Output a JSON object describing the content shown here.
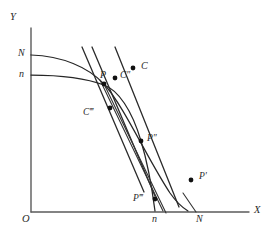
{
  "figure": {
    "background_color": "#ffffff",
    "ink_color": "#262626",
    "axis_color": "#5b5b5b",
    "width": 273,
    "height": 244
  },
  "axes": {
    "y_axis_label": "Y",
    "x_axis_label": "X",
    "origin_label": "O",
    "y_tick_labels": [
      {
        "label": "N",
        "value_y": 55
      },
      {
        "label": "n",
        "value_y": 75
      }
    ],
    "x_tick_labels": [
      {
        "label": "n",
        "value_x": 155
      },
      {
        "label": "N",
        "value_x": 200
      }
    ]
  },
  "points": [
    {
      "name": "P",
      "label": "P",
      "x": 104,
      "y": 84,
      "label_x": 100,
      "label_y": 70
    },
    {
      "name": "Cpp",
      "label": "C″",
      "x": 115,
      "y": 78,
      "label_x": 120,
      "label_y": 72
    },
    {
      "name": "C",
      "label": "C",
      "x": 133,
      "y": 68,
      "label_x": 140,
      "label_y": 62
    },
    {
      "name": "Cppp",
      "label": "C‴",
      "x": 110,
      "y": 108,
      "label_x": 85,
      "label_y": 108
    },
    {
      "name": "Ppp",
      "label": "P″",
      "x": 141,
      "y": 141,
      "label_x": 147,
      "label_y": 134
    },
    {
      "name": "Pp",
      "label": "P′",
      "x": 191,
      "y": 180,
      "label_x": 198,
      "label_y": 173
    },
    {
      "name": "Pppp",
      "label": "P‴",
      "x": 155,
      "y": 199,
      "label_x": 136,
      "label_y": 196
    }
  ],
  "curves": [
    {
      "name": "outer-transformation-curve",
      "from": "N on Y-axis",
      "to": "N on X-axis"
    },
    {
      "name": "inner-transformation-curve",
      "from": "n on Y-axis",
      "to": "n on X-axis"
    }
  ],
  "price_lines": [
    {
      "name": "price-line-1",
      "through": "C"
    },
    {
      "name": "price-line-2",
      "through": "C″"
    },
    {
      "name": "price-line-3",
      "through": "P"
    },
    {
      "name": "price-line-4",
      "through": "P″"
    }
  ]
}
